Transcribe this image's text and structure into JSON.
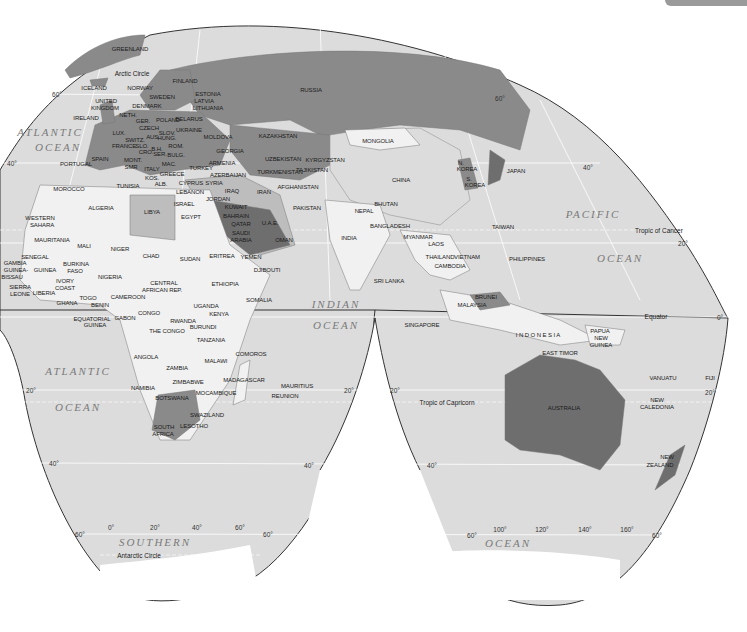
{
  "map": {
    "projection": "interrupted-goode",
    "colors": {
      "ocean": "#dcdcdc",
      "land_light": "#f1f1f1",
      "land_mid": "#bdbdbd",
      "land_dark": "#8a8a8a",
      "land_darker": "#6e6e6e",
      "grid": "#ffffff",
      "outline": "#333333"
    },
    "oceans": [
      {
        "name": "ATLANTIC",
        "x": 50,
        "y": 132
      },
      {
        "name": "OCEAN",
        "x": 58,
        "y": 147
      },
      {
        "name": "PACIFIC",
        "x": 593,
        "y": 214
      },
      {
        "name": "OCEAN",
        "x": 620,
        "y": 258
      },
      {
        "name": "INDIAN",
        "x": 336,
        "y": 304
      },
      {
        "name": "OCEAN",
        "x": 336,
        "y": 325
      },
      {
        "name": "ATLANTIC",
        "x": 78,
        "y": 371
      },
      {
        "name": "OCEAN",
        "x": 78,
        "y": 407
      },
      {
        "name": "SOUTHERN",
        "x": 155,
        "y": 542
      },
      {
        "name": "OCEAN",
        "x": 508,
        "y": 543
      }
    ],
    "reference_lines": [
      {
        "name": "Arctic Circle",
        "x": 132,
        "y": 73
      },
      {
        "name": "Tropic of Cancer",
        "x": 659,
        "y": 230
      },
      {
        "name": "Equator",
        "x": 656,
        "y": 316
      },
      {
        "name": "Tropic of Capricorn",
        "x": 447,
        "y": 402
      },
      {
        "name": "Antarctic Circle",
        "x": 139,
        "y": 555
      }
    ],
    "graticule_labels": [
      {
        "t": "60°",
        "x": 57,
        "y": 94
      },
      {
        "t": "40°",
        "x": 12,
        "y": 163
      },
      {
        "t": "60°",
        "x": 500,
        "y": 98
      },
      {
        "t": "40°",
        "x": 588,
        "y": 167
      },
      {
        "t": "20°",
        "x": 683,
        "y": 243
      },
      {
        "t": "0°",
        "x": 720,
        "y": 317
      },
      {
        "t": "20°",
        "x": 31,
        "y": 390
      },
      {
        "t": "20°",
        "x": 349,
        "y": 390
      },
      {
        "t": "20°",
        "x": 395,
        "y": 390
      },
      {
        "t": "20°",
        "x": 710,
        "y": 392
      },
      {
        "t": "40°",
        "x": 54,
        "y": 463
      },
      {
        "t": "40°",
        "x": 309,
        "y": 465
      },
      {
        "t": "40°",
        "x": 432,
        "y": 465
      },
      {
        "t": "60°",
        "x": 80,
        "y": 534
      },
      {
        "t": "0°",
        "x": 111,
        "y": 527
      },
      {
        "t": "20°",
        "x": 155,
        "y": 527
      },
      {
        "t": "40°",
        "x": 197,
        "y": 527
      },
      {
        "t": "60°",
        "x": 240,
        "y": 527
      },
      {
        "t": "60°",
        "x": 268,
        "y": 534
      },
      {
        "t": "60°",
        "x": 472,
        "y": 535
      },
      {
        "t": "100°",
        "x": 500,
        "y": 529
      },
      {
        "t": "120°",
        "x": 542,
        "y": 529
      },
      {
        "t": "140°",
        "x": 585,
        "y": 529
      },
      {
        "t": "160°",
        "x": 627,
        "y": 529
      },
      {
        "t": "60°",
        "x": 657,
        "y": 535
      }
    ],
    "countries": [
      {
        "n": "GREENLAND",
        "x": 130,
        "y": 49
      },
      {
        "n": "ICELAND",
        "x": 94,
        "y": 88
      },
      {
        "n": "NORWAY",
        "x": 140,
        "y": 88
      },
      {
        "n": "FINLAND",
        "x": 185,
        "y": 81
      },
      {
        "n": "SWEDEN",
        "x": 162,
        "y": 97
      },
      {
        "n": "ESTONIA",
        "x": 208,
        "y": 94
      },
      {
        "n": "LATVIA",
        "x": 204,
        "y": 101
      },
      {
        "n": "LITHUANIA",
        "x": 208,
        "y": 108
      },
      {
        "n": "UNITED",
        "x": 106,
        "y": 101
      },
      {
        "n": "KINGDOM",
        "x": 105,
        "y": 108
      },
      {
        "n": "DENMARK",
        "x": 147,
        "y": 106
      },
      {
        "n": "IRELAND",
        "x": 86,
        "y": 118
      },
      {
        "n": "NETH.",
        "x": 128,
        "y": 115
      },
      {
        "n": "GER.",
        "x": 143,
        "y": 121
      },
      {
        "n": "POLAND",
        "x": 168,
        "y": 120
      },
      {
        "n": "BELARUS",
        "x": 189,
        "y": 119
      },
      {
        "n": "LUX.",
        "x": 119,
        "y": 133
      },
      {
        "n": "CZECH",
        "x": 149,
        "y": 128
      },
      {
        "n": "SLOV.",
        "x": 167,
        "y": 133
      },
      {
        "n": "UKRAINE",
        "x": 189,
        "y": 130
      },
      {
        "n": "AUS.",
        "x": 153,
        "y": 137
      },
      {
        "n": "HUNG.",
        "x": 167,
        "y": 138
      },
      {
        "n": "MOLDOVA",
        "x": 218,
        "y": 137
      },
      {
        "n": "SWITZ.",
        "x": 135,
        "y": 140
      },
      {
        "n": "FRANCE",
        "x": 124,
        "y": 146
      },
      {
        "n": "SLO.",
        "x": 142,
        "y": 146
      },
      {
        "n": "CRO.",
        "x": 146,
        "y": 152
      },
      {
        "n": "B.H.",
        "x": 157,
        "y": 149
      },
      {
        "n": "ROM.",
        "x": 176,
        "y": 146
      },
      {
        "n": "SER.",
        "x": 160,
        "y": 154
      },
      {
        "n": "GEORGIA",
        "x": 230,
        "y": 151
      },
      {
        "n": "SPAIN",
        "x": 100,
        "y": 159
      },
      {
        "n": "PORTUGAL",
        "x": 76,
        "y": 164
      },
      {
        "n": "MONT.",
        "x": 133,
        "y": 160
      },
      {
        "n": "BULG.",
        "x": 176,
        "y": 155
      },
      {
        "n": "ARMENIA",
        "x": 222,
        "y": 163
      },
      {
        "n": "SMR",
        "x": 131,
        "y": 167
      },
      {
        "n": "ITALY",
        "x": 152,
        "y": 169
      },
      {
        "n": "MAC.",
        "x": 169,
        "y": 164
      },
      {
        "n": "TURKEY",
        "x": 201,
        "y": 168
      },
      {
        "n": "AZERBAIJAN",
        "x": 228,
        "y": 175
      },
      {
        "n": "KOS.",
        "x": 152,
        "y": 178
      },
      {
        "n": "GREECE",
        "x": 172,
        "y": 174
      },
      {
        "n": "ALB.",
        "x": 161,
        "y": 184
      },
      {
        "n": "CYPRUS",
        "x": 191,
        "y": 183
      },
      {
        "n": "SYRIA",
        "x": 214,
        "y": 183
      },
      {
        "n": "LEBANON",
        "x": 190,
        "y": 192
      },
      {
        "n": "IRAQ",
        "x": 232,
        "y": 191
      },
      {
        "n": "MOROCCO",
        "x": 69,
        "y": 189
      },
      {
        "n": "TUNISIA",
        "x": 128,
        "y": 186
      },
      {
        "n": "ISRAEL",
        "x": 184,
        "y": 204
      },
      {
        "n": "JORDAN",
        "x": 218,
        "y": 199
      },
      {
        "n": "KUWAIT",
        "x": 236,
        "y": 207
      },
      {
        "n": "IRAN",
        "x": 264,
        "y": 192
      },
      {
        "n": "ALGERIA",
        "x": 101,
        "y": 208
      },
      {
        "n": "LIBYA",
        "x": 152,
        "y": 212
      },
      {
        "n": "EGYPT",
        "x": 191,
        "y": 217
      },
      {
        "n": "BAHRAIN",
        "x": 236,
        "y": 216
      },
      {
        "n": "QATAR",
        "x": 241,
        "y": 224
      },
      {
        "n": "U.A.E.",
        "x": 270,
        "y": 223
      },
      {
        "n": "SAUDI",
        "x": 241,
        "y": 233
      },
      {
        "n": "ARABIA",
        "x": 241,
        "y": 240
      },
      {
        "n": "OMAN",
        "x": 284,
        "y": 240
      },
      {
        "n": "WESTERN",
        "x": 40,
        "y": 218
      },
      {
        "n": "SAHARA",
        "x": 42,
        "y": 225
      },
      {
        "n": "MAURITANIA",
        "x": 52,
        "y": 240
      },
      {
        "n": "MALI",
        "x": 84,
        "y": 246
      },
      {
        "n": "NIGER",
        "x": 120,
        "y": 249
      },
      {
        "n": "CHAD",
        "x": 151,
        "y": 256
      },
      {
        "n": "SUDAN",
        "x": 190,
        "y": 259
      },
      {
        "n": "ERITREA",
        "x": 222,
        "y": 256
      },
      {
        "n": "YEMEN",
        "x": 251,
        "y": 257
      },
      {
        "n": "DJIBOUTI",
        "x": 267,
        "y": 270
      },
      {
        "n": "SENEGAL",
        "x": 35,
        "y": 257
      },
      {
        "n": "GAMBIA",
        "x": 15,
        "y": 263
      },
      {
        "n": "GUINEA-",
        "x": 16,
        "y": 270
      },
      {
        "n": "BISSAU",
        "x": 12,
        "y": 277
      },
      {
        "n": "GUINEA",
        "x": 45,
        "y": 270
      },
      {
        "n": "BURKINA",
        "x": 76,
        "y": 264
      },
      {
        "n": "FASO",
        "x": 75,
        "y": 271
      },
      {
        "n": "NIGERIA",
        "x": 110,
        "y": 277
      },
      {
        "n": "CENTRAL",
        "x": 164,
        "y": 283
      },
      {
        "n": "AFRICAN REP.",
        "x": 162,
        "y": 290
      },
      {
        "n": "ETHIOPIA",
        "x": 225,
        "y": 284
      },
      {
        "n": "SIERRA",
        "x": 20,
        "y": 287
      },
      {
        "n": "LEONE",
        "x": 20,
        "y": 294
      },
      {
        "n": "LIBERIA",
        "x": 44,
        "y": 293
      },
      {
        "n": "IVORY",
        "x": 65,
        "y": 281
      },
      {
        "n": "COAST",
        "x": 65,
        "y": 288
      },
      {
        "n": "GHANA",
        "x": 67,
        "y": 303
      },
      {
        "n": "TOGO",
        "x": 88,
        "y": 298
      },
      {
        "n": "BENIN",
        "x": 100,
        "y": 305
      },
      {
        "n": "CAMEROON",
        "x": 128,
        "y": 297
      },
      {
        "n": "SOMALIA",
        "x": 259,
        "y": 300
      },
      {
        "n": "UGANDA",
        "x": 206,
        "y": 306
      },
      {
        "n": "CONGO",
        "x": 149,
        "y": 313
      },
      {
        "n": "EQUATORIAL",
        "x": 92,
        "y": 319
      },
      {
        "n": "GUINEA",
        "x": 95,
        "y": 325
      },
      {
        "n": "GABON",
        "x": 125,
        "y": 318
      },
      {
        "n": "KENYA",
        "x": 219,
        "y": 314
      },
      {
        "n": "RWANDA",
        "x": 183,
        "y": 321
      },
      {
        "n": "BURUNDI",
        "x": 203,
        "y": 327
      },
      {
        "n": "THE CONGO",
        "x": 167,
        "y": 331
      },
      {
        "n": "TANZANIA",
        "x": 211,
        "y": 340
      },
      {
        "n": "ANGOLA",
        "x": 146,
        "y": 357
      },
      {
        "n": "ZAMBIA",
        "x": 177,
        "y": 368
      },
      {
        "n": "MALAWI",
        "x": 216,
        "y": 361
      },
      {
        "n": "COMOROS",
        "x": 251,
        "y": 354
      },
      {
        "n": "ZIMBABWE",
        "x": 188,
        "y": 382
      },
      {
        "n": "MADAGASCAR",
        "x": 244,
        "y": 380
      },
      {
        "n": "NAMIBIA",
        "x": 143,
        "y": 388
      },
      {
        "n": "MOCAMBIQUE",
        "x": 216,
        "y": 393
      },
      {
        "n": "MAURITIUS",
        "x": 297,
        "y": 386
      },
      {
        "n": "REUNION",
        "x": 285,
        "y": 396
      },
      {
        "n": "BOTSWANA",
        "x": 172,
        "y": 398
      },
      {
        "n": "SWAZILAND",
        "x": 207,
        "y": 415
      },
      {
        "n": "SOUTH",
        "x": 164,
        "y": 427
      },
      {
        "n": "AFRICA",
        "x": 163,
        "y": 434
      },
      {
        "n": "LESOTHO",
        "x": 194,
        "y": 426
      },
      {
        "n": "RUSSIA",
        "x": 311,
        "y": 90
      },
      {
        "n": "KAZAKHSTAN",
        "x": 278,
        "y": 136
      },
      {
        "n": "MONGOLIA",
        "x": 378,
        "y": 141
      },
      {
        "n": "UZBEKISTAN",
        "x": 283,
        "y": 159
      },
      {
        "n": "KYRGYZSTAN",
        "x": 325,
        "y": 160
      },
      {
        "n": "TURKMENISTAN",
        "x": 280,
        "y": 172
      },
      {
        "n": "TAJIKISTAN",
        "x": 312,
        "y": 170
      },
      {
        "n": "AFGHANISTAN",
        "x": 298,
        "y": 187
      },
      {
        "n": "CHINA",
        "x": 401,
        "y": 180
      },
      {
        "n": "N.",
        "x": 461,
        "y": 163
      },
      {
        "n": "KOREA",
        "x": 467,
        "y": 169
      },
      {
        "n": "S.",
        "x": 469,
        "y": 179
      },
      {
        "n": "KOREA",
        "x": 475,
        "y": 185
      },
      {
        "n": "JAPAN",
        "x": 516,
        "y": 171
      },
      {
        "n": "PAKISTAN",
        "x": 307,
        "y": 208
      },
      {
        "n": "NEPAL",
        "x": 364,
        "y": 211
      },
      {
        "n": "BHUTAN",
        "x": 386,
        "y": 204
      },
      {
        "n": "BANGLADESH",
        "x": 390,
        "y": 226
      },
      {
        "n": "INDIA",
        "x": 349,
        "y": 238
      },
      {
        "n": "MYANMAR",
        "x": 418,
        "y": 237
      },
      {
        "n": "TAIWAN",
        "x": 503,
        "y": 227
      },
      {
        "n": "LAOS",
        "x": 436,
        "y": 244
      },
      {
        "n": "THAILAND",
        "x": 440,
        "y": 257
      },
      {
        "n": "VIETNAM",
        "x": 467,
        "y": 257
      },
      {
        "n": "CAMBODIA",
        "x": 450,
        "y": 266
      },
      {
        "n": "PHILIPPINES",
        "x": 527,
        "y": 259
      },
      {
        "n": "SRI LANKA",
        "x": 389,
        "y": 281
      },
      {
        "n": "BRUNEI",
        "x": 486,
        "y": 297
      },
      {
        "n": "MALAYSIA",
        "x": 472,
        "y": 305
      },
      {
        "n": "SINGAPORE",
        "x": 422,
        "y": 325
      },
      {
        "n": "PAPUA",
        "x": 600,
        "y": 331
      },
      {
        "n": "NEW",
        "x": 601,
        "y": 338
      },
      {
        "n": "GUINEA",
        "x": 601,
        "y": 345
      },
      {
        "n": "EAST TIMOR",
        "x": 560,
        "y": 353
      },
      {
        "n": "VANUATU",
        "x": 663,
        "y": 378
      },
      {
        "n": "FIJI",
        "x": 710,
        "y": 378
      },
      {
        "n": "NEW",
        "x": 657,
        "y": 400
      },
      {
        "n": "CALEDONIA",
        "x": 657,
        "y": 407
      },
      {
        "n": "NEW",
        "x": 667,
        "y": 457
      },
      {
        "n": "ZEALAND",
        "x": 660,
        "y": 465
      }
    ],
    "special_labels": [
      {
        "n": "I N D O N E S I A",
        "x": 538,
        "y": 335
      },
      {
        "n": "AUSTRALIA",
        "x": 564,
        "y": 408
      }
    ]
  }
}
